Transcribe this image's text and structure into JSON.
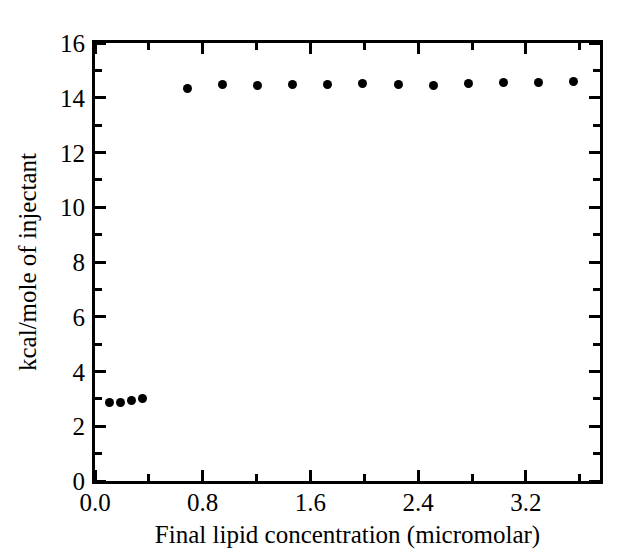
{
  "chart_data": {
    "type": "scatter",
    "title": "",
    "xlabel": "Final lipid concentration (micromolar)",
    "ylabel": "kcal/mole of injectant",
    "xlim": [
      0.0,
      3.75
    ],
    "ylim": [
      0,
      16
    ],
    "grid": false,
    "legend": null,
    "x_ticks_major": [
      "0.0",
      "0.8",
      "1.6",
      "2.4",
      "3.2"
    ],
    "x_ticks_major_values": [
      0.0,
      0.8,
      1.6,
      2.4,
      3.2
    ],
    "x_ticks_minor_values": [
      0.4,
      1.2,
      2.0,
      2.8,
      3.6
    ],
    "y_ticks_major": [
      "0",
      "2",
      "4",
      "6",
      "8",
      "10",
      "12",
      "14",
      "16"
    ],
    "y_ticks_major_values": [
      0,
      2,
      4,
      6,
      8,
      10,
      12,
      14,
      16
    ],
    "y_ticks_minor_values": [
      1,
      3,
      5,
      7,
      9,
      11,
      13,
      15
    ],
    "marker": "filled-circle",
    "marker_color": "#000000",
    "series": [
      {
        "name": "injectant heat",
        "points": [
          [
            0.11,
            2.85
          ],
          [
            0.19,
            2.88
          ],
          [
            0.27,
            2.93
          ],
          [
            0.35,
            3.0
          ],
          [
            0.69,
            14.35
          ],
          [
            0.95,
            14.47
          ],
          [
            1.21,
            14.45
          ],
          [
            1.47,
            14.47
          ],
          [
            1.73,
            14.49
          ],
          [
            1.99,
            14.53
          ],
          [
            2.25,
            14.5
          ],
          [
            2.51,
            14.45
          ],
          [
            2.77,
            14.52
          ],
          [
            3.03,
            14.55
          ],
          [
            3.29,
            14.57
          ],
          [
            3.55,
            14.58
          ]
        ]
      }
    ]
  },
  "figure": {
    "background_color": "#ffffff",
    "axis_color": "#000000"
  }
}
